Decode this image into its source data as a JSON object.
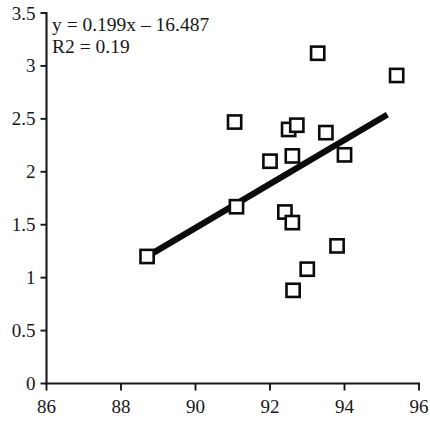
{
  "chart_data": {
    "type": "scatter",
    "title": "",
    "subtitle": "",
    "xlabel": "",
    "ylabel": "",
    "xlim": [
      86,
      96
    ],
    "ylim": [
      0,
      3.5
    ],
    "grid": false,
    "legend": null,
    "legend_position": "none",
    "x_ticks": [
      86,
      88,
      90,
      92,
      94,
      96
    ],
    "x_tick_labels": [
      "86",
      "88",
      "90",
      "92",
      "94",
      "96"
    ],
    "y_ticks": [
      0,
      0.5,
      1,
      1.5,
      2,
      2.5,
      3,
      3.5
    ],
    "y_tick_labels": [
      "0",
      "0.5",
      "1",
      "1.5",
      "2",
      "2.5",
      "3",
      "3.5"
    ],
    "marker": "open-square",
    "marker_color": "#0b0b0d",
    "marker_fill": "#ffffff",
    "points": [
      {
        "x": 88.7,
        "y": 1.2
      },
      {
        "x": 91.05,
        "y": 2.47
      },
      {
        "x": 91.1,
        "y": 1.67
      },
      {
        "x": 92.0,
        "y": 2.1
      },
      {
        "x": 92.4,
        "y": 1.62
      },
      {
        "x": 92.5,
        "y": 2.4
      },
      {
        "x": 92.6,
        "y": 2.15
      },
      {
        "x": 92.72,
        "y": 2.44
      },
      {
        "x": 92.6,
        "y": 1.52
      },
      {
        "x": 92.62,
        "y": 0.88
      },
      {
        "x": 93.0,
        "y": 1.08
      },
      {
        "x": 93.28,
        "y": 3.12
      },
      {
        "x": 93.5,
        "y": 2.37
      },
      {
        "x": 93.8,
        "y": 1.3
      },
      {
        "x": 94.0,
        "y": 2.16
      },
      {
        "x": 95.4,
        "y": 2.91
      }
    ],
    "trendline": {
      "type": "linear",
      "slope": 0.199,
      "intercept": -16.487,
      "r_squared": 0.19,
      "x_start": 88.7,
      "x_end": 95.15,
      "y_start": 1.2,
      "y_end": 2.54,
      "color": "#0b0b0d"
    },
    "annotations": {
      "equation": "y = 0.199x – 16.487",
      "r_squared_label": "R2 = 0.19"
    }
  },
  "colors": {
    "axis": "#17171a",
    "marker_stroke": "#0b0b0d",
    "marker_fill": "#ffffff",
    "trend": "#0b0b0d",
    "background": "#ffffff"
  }
}
